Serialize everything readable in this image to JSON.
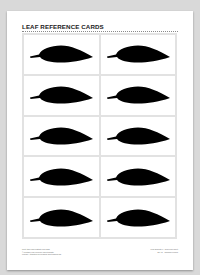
{
  "page": {
    "title": "LEAF REFERENCE CARDS",
    "grid": {
      "columns": 2,
      "rows": 5,
      "cards": [
        {
          "icon": "leaf-icon"
        },
        {
          "icon": "leaf-icon"
        },
        {
          "icon": "leaf-icon"
        },
        {
          "icon": "leaf-icon"
        },
        {
          "icon": "leaf-icon"
        },
        {
          "icon": "leaf-icon"
        },
        {
          "icon": "leaf-icon"
        },
        {
          "icon": "leaf-icon"
        },
        {
          "icon": "leaf-icon"
        },
        {
          "icon": "leaf-icon"
        }
      ]
    },
    "footer": {
      "left_lines": [
        "Print, trace and illustrate leaf cards",
        "© Printable leaf reference card template",
        "License: Attribution for personal and teaching use"
      ],
      "right_lines": [
        "Leaf Template 1 · Reference sheet",
        "No. 01 · Common Leaves"
      ]
    }
  },
  "colors": {
    "background": "#d9d9d9",
    "page": "#ffffff",
    "leaf": "#000000",
    "grid_line": "#e2e2e2",
    "title": "#222222"
  }
}
